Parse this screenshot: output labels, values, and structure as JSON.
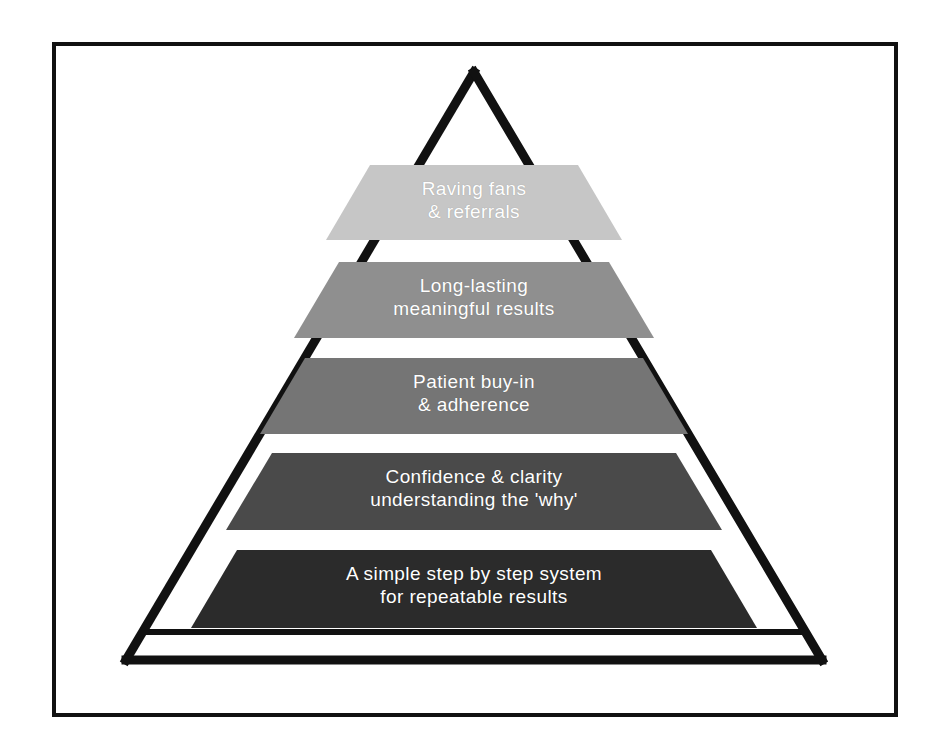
{
  "diagram": {
    "type": "pyramid",
    "orientation": "apex-up",
    "frame_color": "#111111",
    "background_color": "#ffffff",
    "apex_outline_color": "#111111",
    "label_text_color": "#ffffff",
    "tier_count": 5,
    "tiers": [
      {
        "index": 1,
        "position": "top",
        "line1": "Raving fans",
        "line2": "& referrals",
        "text": "Raving fans\n& referrals",
        "color": "#c6c6c6",
        "font_size": 19
      },
      {
        "index": 2,
        "position": "second",
        "line1": "Long-lasting",
        "line2": "meaningful results",
        "text": "Long-lasting\nmeaningful results",
        "color": "#8f8f8f",
        "font_size": 19
      },
      {
        "index": 3,
        "position": "middle",
        "line1": "Patient buy-in",
        "line2": "& adherence",
        "text": "Patient buy-in\n& adherence",
        "color": "#757575",
        "font_size": 19
      },
      {
        "index": 4,
        "position": "fourth",
        "line1": "Confidence & clarity",
        "line2": "understanding the 'why'",
        "text": "Confidence & clarity\nunderstanding the 'why'",
        "color": "#4a4a4a",
        "font_size": 19
      },
      {
        "index": 5,
        "position": "base",
        "line1": "A simple step by step system",
        "line2": "for repeatable results",
        "text": "A simple step by step system\nfor repeatable results",
        "color": "#2b2b2b",
        "font_size": 19
      }
    ],
    "apex": {
      "label": "",
      "shape": "open-triangle-outline"
    },
    "base_plinth": {
      "label": "",
      "shape": "open-trapezoid-outline"
    }
  }
}
